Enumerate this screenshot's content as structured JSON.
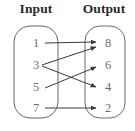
{
  "diagram": {
    "type": "function-mapping-diagram",
    "headings": {
      "input": "Input",
      "output": "Output"
    },
    "colors": {
      "heading_text": "#2b2b2b",
      "node_text": "#6e6e6e",
      "oval_stroke": "#6b6b6b",
      "arrow_stroke": "#3a3a3a",
      "background": "#ffffff"
    },
    "input_set": {
      "name": "Input",
      "items": [
        {
          "label": "1",
          "x": 36,
          "y": 43
        },
        {
          "label": "3",
          "x": 36,
          "y": 65
        },
        {
          "label": "5",
          "x": 36,
          "y": 87
        },
        {
          "label": "7",
          "x": 36,
          "y": 108
        }
      ],
      "oval": {
        "x": 14,
        "y": 26,
        "width": 44,
        "height": 92,
        "rx": 16
      }
    },
    "output_set": {
      "name": "Output",
      "items": [
        {
          "label": "8",
          "x": 108,
          "y": 43
        },
        {
          "label": "6",
          "x": 108,
          "y": 65
        },
        {
          "label": "4",
          "x": 108,
          "y": 87
        },
        {
          "label": "2",
          "x": 108,
          "y": 108
        }
      ],
      "oval": {
        "x": 85,
        "y": 26,
        "width": 40,
        "height": 92,
        "rx": 15
      }
    },
    "mappings": [
      {
        "from": "1",
        "to": "8",
        "x1": 45,
        "y1": 43,
        "x2": 96,
        "y2": 42
      },
      {
        "from": "3",
        "to": "8",
        "x1": 42,
        "y1": 65,
        "x2": 96,
        "y2": 47
      },
      {
        "from": "3",
        "to": "4",
        "x1": 42,
        "y1": 66,
        "x2": 96,
        "y2": 87
      },
      {
        "from": "5",
        "to": "6",
        "x1": 45,
        "y1": 88,
        "x2": 96,
        "y2": 67
      },
      {
        "from": "7",
        "to": "2",
        "x1": 45,
        "y1": 108,
        "x2": 96,
        "y2": 108
      }
    ]
  }
}
